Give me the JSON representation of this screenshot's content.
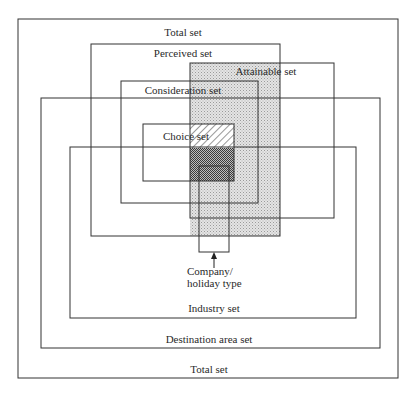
{
  "diagram": {
    "type": "nested-sets",
    "sets": {
      "total": {
        "label_top": "Total set",
        "label_bottom": "Total set"
      },
      "perceived": {
        "label": "Perceived set"
      },
      "attainable": {
        "label": "Attainable set"
      },
      "consideration": {
        "label": "Consideration set"
      },
      "choice": {
        "label": "Choice set"
      },
      "destination_area": {
        "label": "Destination area set"
      },
      "industry": {
        "label": "Industry set"
      }
    },
    "pointer": {
      "line1": "Company/",
      "line2": "holiday type"
    },
    "colors": {
      "stroke": "#333333",
      "attainable_fill": "#d9d9d9",
      "crosshatch_fill": "#555555",
      "background": "#ffffff"
    }
  }
}
